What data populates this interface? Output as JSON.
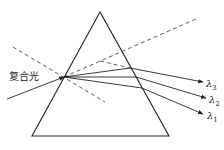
{
  "diagram": {
    "type": "prism-dispersion",
    "input_label": "复合光",
    "output_labels": [
      {
        "symbol": "λ",
        "sub": "3"
      },
      {
        "symbol": "λ",
        "sub": "2"
      },
      {
        "symbol": "λ",
        "sub": "1"
      }
    ],
    "colors": {
      "line": "#222222",
      "background": "#ffffff"
    }
  }
}
